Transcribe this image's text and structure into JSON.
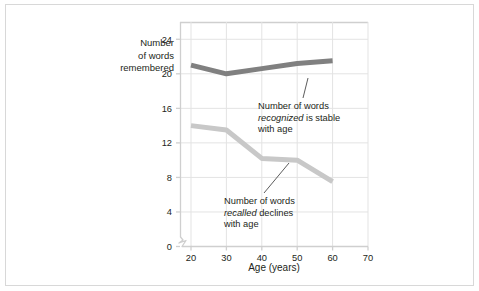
{
  "figure": {
    "background_color": "#ffffff",
    "border_color": "#d8d8d8"
  },
  "chart_data": {
    "type": "line",
    "title": "",
    "xlabel": "Age (years)",
    "ylabel": "Number of words remembered",
    "x": [
      20,
      30,
      40,
      50,
      60
    ],
    "xticks": [
      20,
      30,
      40,
      50,
      60,
      70
    ],
    "xticklabels": [
      "20",
      "30",
      "40",
      "50",
      "60",
      "70"
    ],
    "yticks": [
      0,
      4,
      8,
      12,
      16,
      20,
      24
    ],
    "yticklabels": [
      "0",
      "4",
      "8",
      "12",
      "16",
      "20",
      "24"
    ],
    "xlim": [
      20,
      70
    ],
    "ylim": [
      0,
      26
    ],
    "grid": true,
    "grid_color": "#e3e3e3",
    "axis_break": true,
    "legend": "none",
    "series": [
      {
        "name": "Number of words recognized",
        "color": "#808080",
        "values": [
          21.0,
          20.0,
          20.6,
          21.2,
          21.5
        ]
      },
      {
        "name": "Number of words recalled",
        "color": "#c8c8c8",
        "values": [
          14.0,
          13.5,
          10.2,
          10.0,
          7.5
        ]
      }
    ],
    "annotations": [
      {
        "id": "recognized",
        "line1": "Number of words",
        "line2_italic": "recognized",
        "line2_rest": " is stable",
        "line3": "with age",
        "points_to_series": "Number of words recognized"
      },
      {
        "id": "recalled",
        "line1": "Number of words",
        "line2_italic": "recalled",
        "line2_rest": " declines",
        "line3": "with age",
        "points_to_series": "Number of words recalled"
      }
    ]
  },
  "ylabel_lines": [
    "Number",
    "of words",
    "remembered"
  ]
}
